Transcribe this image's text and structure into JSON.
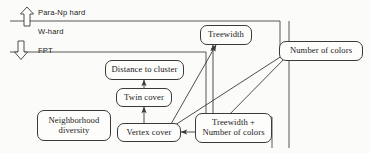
{
  "diagram": {
    "background": "#fbfbf9",
    "line_color": "#3a3a3a",
    "regions": [
      {
        "id": "para-np-hard",
        "label": "Para-Np hard",
        "arrow": "up"
      },
      {
        "id": "w-hard",
        "label": "W-hard",
        "arrow": "none"
      },
      {
        "id": "fpt",
        "label": "FPT",
        "arrow": "down"
      }
    ],
    "nodes": [
      {
        "id": "treewidth",
        "lines": [
          "Treewidth"
        ]
      },
      {
        "id": "number-of-colors",
        "lines": [
          "Number of colors"
        ]
      },
      {
        "id": "distance-to-cluster",
        "lines": [
          "Distance to cluster"
        ]
      },
      {
        "id": "twin-cover",
        "lines": [
          "Twin cover"
        ]
      },
      {
        "id": "neighborhood-diversity",
        "lines": [
          "Neighborhood",
          "diversity"
        ]
      },
      {
        "id": "vertex-cover",
        "lines": [
          "Vertex cover"
        ]
      },
      {
        "id": "treewidth-plus-colors",
        "lines": [
          "Treewidth +",
          "Number of colors"
        ]
      }
    ],
    "edges": [
      {
        "from": "twin-cover",
        "to": "distance-to-cluster"
      },
      {
        "from": "vertex-cover",
        "to": "twin-cover"
      },
      {
        "from": "treewidth-plus-colors",
        "to": "vertex-cover"
      },
      {
        "from": "treewidth-plus-colors",
        "to": "treewidth"
      },
      {
        "from": "vertex-cover",
        "to": "treewidth"
      },
      {
        "from": "vertex-cover",
        "to": "number-of-colors"
      },
      {
        "from": "treewidth-plus-colors",
        "to": "number-of-colors"
      }
    ]
  }
}
